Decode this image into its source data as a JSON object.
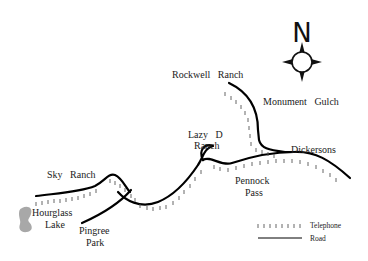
{
  "map": {
    "labels": {
      "rockwell_ranch": "Rockwell   Ranch",
      "monument_gulch": "Monument   Gulch",
      "lazy_d_line1": "Lazy   D",
      "lazy_d_line2": "Ranch",
      "dickersons": "Dickersons",
      "pennock_line1": "Pennock",
      "pennock_line2": "Pass",
      "sky_ranch": "Sky   Ranch",
      "hourglass_line1": "Hourglass",
      "hourglass_line2": "Lake",
      "pingree_line1": "Pingree",
      "pingree_line2": "Park"
    },
    "compass": {
      "letter": "N"
    },
    "legend": {
      "telephone_label": "Telephone",
      "road_label": "Road",
      "telephone_symbol": "ı ı ı ı ı ı ı ı"
    },
    "colors": {
      "road": "#000000",
      "telephone": "#555555",
      "lake": "#a8a8a8",
      "text": "#222222"
    }
  }
}
